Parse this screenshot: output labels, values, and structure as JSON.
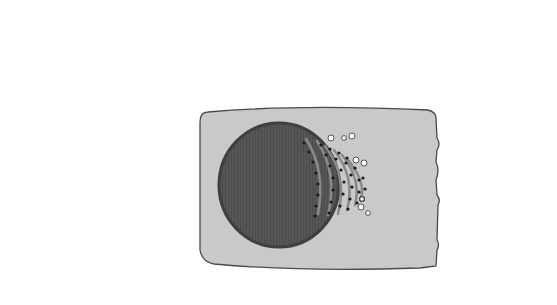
{
  "diagram": {
    "type": "cell-secretion-diagram",
    "colors": {
      "cytoplasm": "#c8c8c8",
      "membrane": "#4a4a4a",
      "nucleus": "#555555",
      "rer": "#8a8a8a",
      "ribosome": "#1a1a1a",
      "golgi": "#8c8c8c",
      "dark_vesicle": "#1c1c1c",
      "endo_vesicle": "#8e8e8e",
      "leader_line": "#444444"
    }
  },
  "labels": {
    "top_1": {
      "lines": [
        "proteins are synthesized",
        "by ribosomes and then",
        "enter the rough",
        "endoplasmic",
        "reticulum"
      ]
    },
    "top_2": {
      "lines": [
        "vesicles bud off from",
        "the rER and carry the",
        "proteins to the Golgi",
        "apparatus"
      ]
    },
    "top_3": {
      "lines": [
        "the Golgi",
        "apparatus",
        "modifies the",
        "proteins"
      ]
    },
    "top_4": {
      "lines": [
        "vesicles bud off from",
        "the Golgi apparatus",
        "and carry the modified",
        "proteins to the plasma",
        "membrane"
      ]
    },
    "endocytosis": {
      "heading": "ENDOCYTOSIS",
      "step_1": [
        "part of the plasma",
        "membrane is pulled inwards"
      ],
      "step_2": [
        "a droplet of fluid becomes",
        "enclosed when a vesicle is",
        "pinched off"
      ],
      "step_3": [
        "vesicles can then move",
        "through the cytoplasm",
        "carrying their contents"
      ]
    },
    "exocytosis": {
      "heading": "EXOCYTOSIS",
      "step_1": [
        "vesicles fuse",
        "with the plasma",
        "membrane"
      ],
      "step_2": [
        "the contents of",
        "the vesicle are",
        "expelled"
      ],
      "step_3": [
        "the membrane",
        "then flattens",
        "out again"
      ]
    }
  }
}
